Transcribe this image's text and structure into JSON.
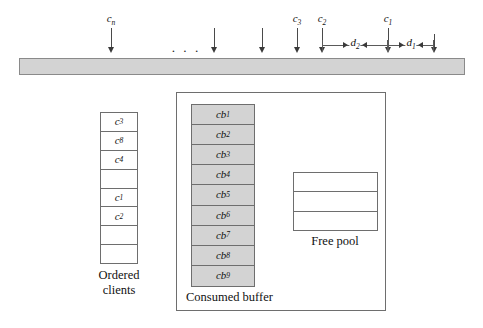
{
  "figure": {
    "colors": {
      "bar_fill": "#d3d3d3",
      "bar_stroke": "#8a8a8a",
      "cell_fill_shaded": "#d3d3d3",
      "cell_stroke": "#6e6e6e",
      "arrow": "#3a3a3a",
      "text": "#111111",
      "background": "#ffffff"
    }
  },
  "timeline": {
    "bar_name": "timeline-bar",
    "ellipsis": "· · ·",
    "ticks": [
      {
        "id": "tick-cn",
        "x": 111,
        "label": "c",
        "sub": "n",
        "has_label": true,
        "shaft_top": 28,
        "shaft_height": 24
      },
      {
        "id": "tick-unlabeled-1",
        "x": 214,
        "label": "",
        "sub": "",
        "has_label": false,
        "shaft_top": 28,
        "shaft_height": 24
      },
      {
        "id": "tick-unlabeled-2",
        "x": 262,
        "label": "",
        "sub": "",
        "has_label": false,
        "shaft_top": 28,
        "shaft_height": 24
      },
      {
        "id": "tick-c3",
        "x": 297,
        "label": "c",
        "sub": "3",
        "has_label": true,
        "shaft_top": 28,
        "shaft_height": 24
      },
      {
        "id": "tick-c2",
        "x": 322,
        "label": "c",
        "sub": "2",
        "has_label": true,
        "shaft_top": 28,
        "shaft_height": 24
      },
      {
        "id": "tick-c1",
        "x": 388,
        "label": "c",
        "sub": "1",
        "has_label": true,
        "shaft_top": 28,
        "shaft_height": 24
      },
      {
        "id": "tick-unlabeled-3",
        "x": 434,
        "label": "",
        "sub": "",
        "has_label": false,
        "shaft_top": 34,
        "shaft_height": 18
      }
    ],
    "measures": [
      {
        "id": "measure-d2",
        "label": "d",
        "sub": "2",
        "from_x": 322,
        "to_x": 388,
        "y": 40
      },
      {
        "id": "measure-d1",
        "label": "d",
        "sub": "1",
        "from_x": 388,
        "to_x": 434,
        "y": 40
      }
    ]
  },
  "ordered_clients": {
    "caption_line1": "Ordered",
    "caption_line2": "clients",
    "cells": [
      {
        "label": "c",
        "sub": "3"
      },
      {
        "label": "c",
        "sub": "8"
      },
      {
        "label": "c",
        "sub": "4"
      },
      {
        "label": "",
        "sub": ""
      },
      {
        "label": "c",
        "sub": "1"
      },
      {
        "label": "c",
        "sub": "2"
      },
      {
        "label": "",
        "sub": ""
      },
      {
        "label": "",
        "sub": ""
      }
    ]
  },
  "consumed_buffer": {
    "caption": "Consumed buffer",
    "cells": [
      {
        "label": "cb",
        "sub": "1"
      },
      {
        "label": "cb",
        "sub": "2"
      },
      {
        "label": "cb",
        "sub": "3"
      },
      {
        "label": "cb",
        "sub": "4"
      },
      {
        "label": "cb",
        "sub": "5"
      },
      {
        "label": "cb",
        "sub": "6"
      },
      {
        "label": "cb",
        "sub": "7"
      },
      {
        "label": "cb",
        "sub": "8"
      },
      {
        "label": "cb",
        "sub": "9"
      }
    ]
  },
  "free_pool": {
    "caption": "Free pool",
    "cells": [
      {
        "label": "",
        "sub": ""
      },
      {
        "label": "",
        "sub": ""
      },
      {
        "label": "",
        "sub": ""
      }
    ]
  }
}
